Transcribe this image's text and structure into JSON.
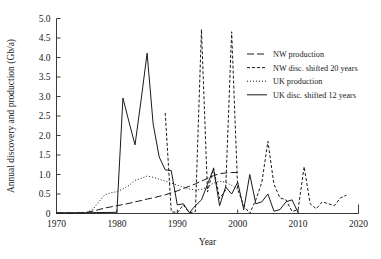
{
  "chart_data": {
    "type": "line",
    "title": "",
    "xlabel": "Year",
    "ylabel": "Annual discovery and production (Gb/a)",
    "xlim": [
      1970,
      2020
    ],
    "ylim": [
      0,
      5.0
    ],
    "xticks": [
      1970,
      1980,
      1990,
      2000,
      2010,
      2020
    ],
    "xtick_labels": [
      "1970",
      "1980",
      "1990",
      "2000",
      "2010",
      "2020"
    ],
    "yticks": [
      0,
      0.5,
      1.0,
      1.5,
      2.0,
      2.5,
      3.0,
      3.5,
      4.0,
      4.5,
      5.0
    ],
    "ytick_labels": [
      "0",
      "0.5",
      "1.0",
      "1.5",
      "2.0",
      "2.5",
      "3.0",
      "3.5",
      "4.0",
      "4.5",
      "5.0"
    ],
    "grid": false,
    "legend_position": "upper right",
    "series": [
      {
        "name": "NW production",
        "style": "long-dash",
        "dash": "7,3",
        "x": [
          1970,
          1971,
          1972,
          1973,
          1974,
          1975,
          1976,
          1977,
          1978,
          1979,
          1980,
          1981,
          1982,
          1983,
          1984,
          1985,
          1986,
          1987,
          1988,
          1989,
          1990,
          1991,
          1992,
          1993,
          1994,
          1995,
          1996,
          1997,
          1998,
          1999,
          2000
        ],
        "values": [
          0.01,
          0.01,
          0.01,
          0.01,
          0.02,
          0.03,
          0.06,
          0.1,
          0.14,
          0.17,
          0.2,
          0.23,
          0.26,
          0.3,
          0.33,
          0.37,
          0.4,
          0.44,
          0.48,
          0.53,
          0.58,
          0.64,
          0.7,
          0.76,
          0.83,
          0.9,
          0.97,
          1.02,
          1.04,
          1.05,
          1.05
        ]
      },
      {
        "name": "NW disc. shifted 20 years",
        "style": "short-dash",
        "dash": "3,2",
        "x": [
          1988,
          1989,
          1990,
          1991,
          1992,
          1993,
          1994,
          1995,
          1996,
          1997,
          1998,
          1999,
          2000,
          2001,
          2002,
          2003,
          2004,
          2005,
          2006,
          2007,
          2008,
          2009,
          2010,
          2011,
          2012,
          2013,
          2014,
          2015,
          2016,
          2017,
          2018
        ],
        "values": [
          2.58,
          0.05,
          0.02,
          0.22,
          0.02,
          0.05,
          4.72,
          0.55,
          1.17,
          0.38,
          0.6,
          4.66,
          0.62,
          0.2,
          0.0,
          0.35,
          0.8,
          1.85,
          0.75,
          0.4,
          0.35,
          0.05,
          0.1,
          1.2,
          0.25,
          0.12,
          0.3,
          0.25,
          0.2,
          0.4,
          0.47
        ]
      },
      {
        "name": "UK production",
        "style": "dotted",
        "dash": "1,2",
        "x": [
          1970,
          1974,
          1975,
          1976,
          1977,
          1978,
          1979,
          1980,
          1981,
          1982,
          1983,
          1984,
          1985,
          1986,
          1987,
          1988,
          1989,
          1990,
          1991,
          1992,
          1993,
          1994,
          1995,
          1996,
          1997,
          1998,
          1999,
          2000
        ],
        "values": [
          0.0,
          0.0,
          0.03,
          0.1,
          0.3,
          0.48,
          0.53,
          0.56,
          0.63,
          0.72,
          0.85,
          0.9,
          0.96,
          0.93,
          0.88,
          0.83,
          0.78,
          0.73,
          0.68,
          0.63,
          0.6,
          0.62,
          0.68,
          0.78,
          0.83,
          0.8,
          0.72,
          0.62
        ]
      },
      {
        "name": "UK disc. shifted 12 years",
        "style": "solid",
        "dash": "",
        "x": [
          1970,
          1975,
          1980,
          1981,
          1982,
          1983,
          1984,
          1985,
          1986,
          1987,
          1988,
          1989,
          1990,
          1991,
          1992,
          1993,
          1994,
          1995,
          1996,
          1997,
          1998,
          1999,
          2000,
          2001,
          2002,
          2003,
          2004,
          2005,
          2006,
          2007,
          2008,
          2009,
          2010
        ],
        "values": [
          0.02,
          0.02,
          0.03,
          2.96,
          2.35,
          1.76,
          2.9,
          4.11,
          2.3,
          1.45,
          1.12,
          1.1,
          0.22,
          0.25,
          0.02,
          0.2,
          0.35,
          0.75,
          1.15,
          0.2,
          0.68,
          0.5,
          0.8,
          0.1,
          1.0,
          0.25,
          0.3,
          0.5,
          0.06,
          0.1,
          0.3,
          0.35,
          0.02
        ]
      }
    ]
  },
  "legend": {
    "entries": [
      {
        "label": "NW production"
      },
      {
        "label": "NW disc. shifted 20 years"
      },
      {
        "label": "UK production"
      },
      {
        "label": "UK disc. shifted 12 years"
      }
    ]
  }
}
